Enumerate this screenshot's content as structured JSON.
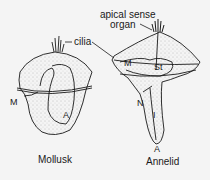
{
  "diagram": {
    "background": "#f4f4f4",
    "ink": "#1a1a1a",
    "figures": [
      {
        "name": "Mollusk",
        "caption": "Mollusk",
        "labels": {
          "cilia": "cilia",
          "mouth": "M",
          "anus": "A"
        }
      },
      {
        "name": "Annelid",
        "caption": "Annelid",
        "labels": {
          "apical_line1": "apical sense",
          "apical_line2": "organ",
          "mouth": "M",
          "stomach": "St",
          "nephridium": "N",
          "intestine": "I",
          "anus": "A"
        }
      }
    ]
  }
}
